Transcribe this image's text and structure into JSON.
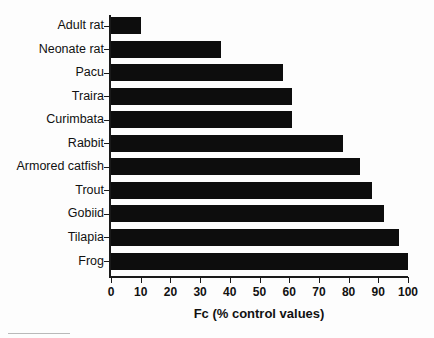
{
  "chart_data": {
    "type": "bar",
    "orientation": "horizontal",
    "title": "",
    "xlabel": "Fc (% control values)",
    "ylabel": "",
    "xlim": [
      0,
      100
    ],
    "ylim": null,
    "grid": false,
    "legend": null,
    "xticks": [
      0,
      10,
      20,
      30,
      40,
      50,
      60,
      70,
      80,
      90,
      100
    ],
    "xticklabels": [
      "0",
      "10",
      "20",
      "30",
      "40",
      "50",
      "60",
      "70",
      "80",
      "90",
      "100"
    ],
    "categories": [
      "Adult rat",
      "Neonate rat",
      "Pacu",
      "Traira",
      "Curimbata",
      "Rabbit",
      "Armored catfish",
      "Trout",
      "Gobiid",
      "Tilapia",
      "Frog"
    ],
    "values": [
      10,
      37,
      58,
      61,
      61,
      78,
      84,
      88,
      92,
      97,
      100
    ],
    "bar_color": "#0d0d0d",
    "background_color": "#fdfdfd",
    "axis_color": "#1a1a1a"
  }
}
